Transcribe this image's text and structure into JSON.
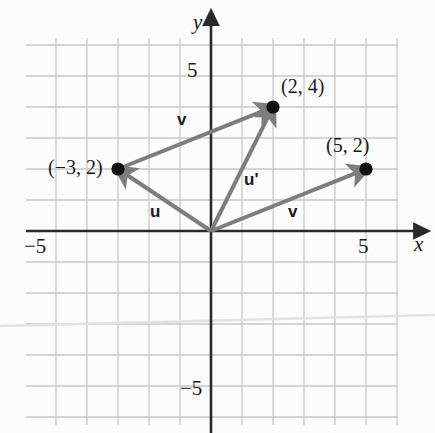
{
  "chart_data": {
    "type": "scatter",
    "title": "",
    "xlabel": "x",
    "ylabel": "y",
    "xlim": [
      -6,
      6
    ],
    "ylim": [
      -6,
      6.5
    ],
    "grid": true,
    "grid_step": 1,
    "legend": "none",
    "x_ticks": [
      {
        "value": -5,
        "label": "−5"
      },
      {
        "value": 5,
        "label": "5"
      }
    ],
    "y_ticks": [
      {
        "value": 5,
        "label": "5"
      },
      {
        "value": -5,
        "label": "−5"
      }
    ],
    "points": [
      {
        "name": "point-2-4",
        "x": 2,
        "y": 4,
        "label": "(2, 4)"
      },
      {
        "name": "point-neg3-2",
        "x": -3,
        "y": 2,
        "label": "(−3, 2)"
      },
      {
        "name": "point-5-2",
        "x": 5,
        "y": 2,
        "label": "(5, 2)"
      }
    ],
    "vectors": [
      {
        "name": "vector-u",
        "label": "u",
        "from": [
          0,
          0
        ],
        "to": [
          -3,
          2
        ]
      },
      {
        "name": "vector-u-prime",
        "label": "u'",
        "from": [
          0,
          0
        ],
        "to": [
          2,
          4
        ]
      },
      {
        "name": "vector-v-upper",
        "label": "v",
        "from": [
          -3,
          2
        ],
        "to": [
          2,
          4
        ]
      },
      {
        "name": "vector-v-lower",
        "label": "v",
        "from": [
          0,
          0
        ],
        "to": [
          5,
          2
        ]
      }
    ],
    "annotations": [
      {
        "name": "label-v-upper",
        "text": "v",
        "x": -0.9,
        "y": 3.6
      },
      {
        "name": "label-u-prime",
        "text": "u'",
        "x": 1.25,
        "y": 1.65
      },
      {
        "name": "label-u",
        "text": "u",
        "x": -1.8,
        "y": 0.62
      },
      {
        "name": "label-v-lower",
        "text": "v",
        "x": 2.65,
        "y": 0.62
      }
    ],
    "colors": {
      "grid": "#c9c9c9",
      "axis": "#2a2a2a",
      "vector": "#7d7d7d",
      "point": "#111111",
      "text": "#1a1a1a",
      "background": "#fcfcfc"
    }
  },
  "axis": {
    "x_name": "x",
    "y_name": "y",
    "x_neg_tick": "−5",
    "x_pos_tick": "5",
    "y_pos_tick": "5",
    "y_neg_tick": "−5"
  },
  "labels": {
    "p1": "(2, 4)",
    "p2": "(−3, 2)",
    "p3": "(5, 2)",
    "v_upper": "v",
    "v_lower": "v",
    "u": "u",
    "u_prime": "u'"
  }
}
